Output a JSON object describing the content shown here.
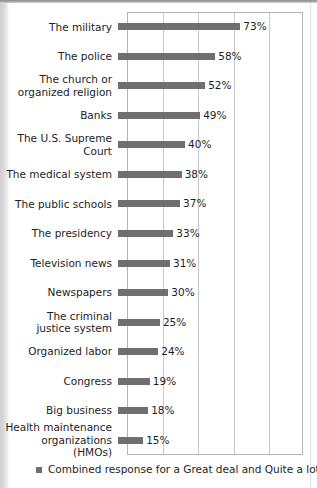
{
  "chart_data": {
    "type": "bar",
    "orientation": "horizontal",
    "title": "",
    "subtitle": "",
    "xlabel": "",
    "ylabel": "",
    "xlim": [
      0,
      105
    ],
    "grid": true,
    "gridline_values": [
      0,
      21,
      42,
      63,
      84,
      105
    ],
    "legend_position": "bottom-left",
    "legend": [
      "Combined response for a Great deal and Quite a lot"
    ],
    "value_suffix": "%",
    "categories": [
      "The military",
      "The police",
      "The church or\norganized religion",
      "Banks",
      "The U.S. Supreme Court",
      "The medical system",
      "The public schools",
      "The presidency",
      "Television news",
      "Newspapers",
      "The criminal\njustice system",
      "Organized labor",
      "Congress",
      "Big business",
      "Health maintenance\norganizations (HMOs)"
    ],
    "values": [
      73,
      58,
      52,
      49,
      40,
      38,
      37,
      33,
      31,
      30,
      25,
      24,
      19,
      18,
      15
    ],
    "value_labels": [
      "73%",
      "58%",
      "52%",
      "49%",
      "40%",
      "38%",
      "37%",
      "33%",
      "31%",
      "30%",
      "25%",
      "24%",
      "19%",
      "18%",
      "15%"
    ],
    "series": [
      {
        "name": "Combined response for a Great deal and Quite a lot",
        "color": "#6f6f6f",
        "values": [
          73,
          58,
          52,
          49,
          40,
          38,
          37,
          33,
          31,
          30,
          25,
          24,
          19,
          18,
          15
        ]
      }
    ]
  },
  "colors": {
    "bar": "#6f6f6f",
    "gridline": "#c9c9c9",
    "plot_border": "#b4b4b4",
    "text": "#242424",
    "background": "#ffffff"
  },
  "legend": {
    "marker": "square-marker",
    "label": "Combined response for a Great deal and Quite a lot"
  }
}
